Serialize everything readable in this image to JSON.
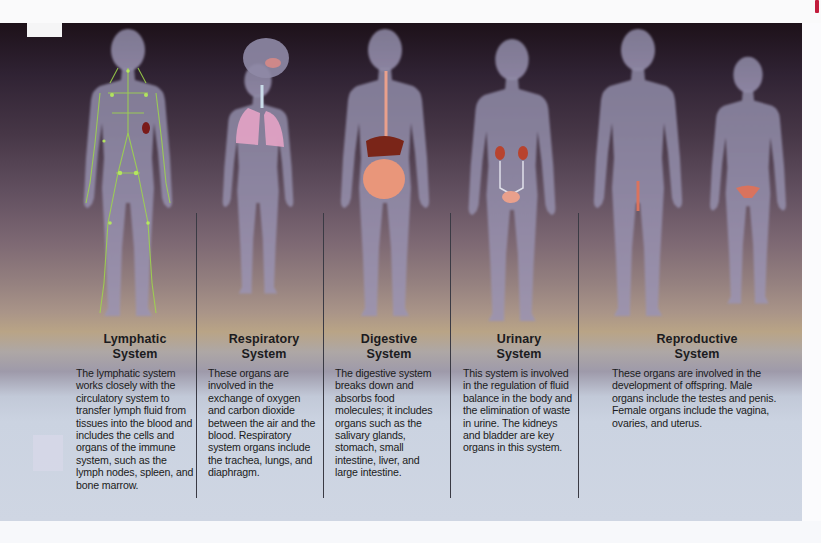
{
  "figure": {
    "systems": [
      {
        "id": "lymphatic",
        "title_line1": "Lymphatic",
        "title_line2": "System",
        "description": "The lymphatic system works closely with the circulatory system to transfer lymph fluid from tissues into the blood and includes the cells and organs of the immune system, such as the lymph nodes, spleen, and bone marrow.",
        "highlight_color": "#9fd84a"
      },
      {
        "id": "respiratory",
        "title_line1": "Respiratory",
        "title_line2": "System",
        "description": "These organs are involved in the exchange of oxygen and carbon dioxide between the air and the blood. Respiratory system organs include the trachea, lungs, and diaphragm.",
        "highlight_color": "#e8a8c6"
      },
      {
        "id": "digestive",
        "title_line1": "Digestive",
        "title_line2": "System",
        "description": "The digestive system breaks down and absorbs food molecules; it includes organs such as the salivary glands, stomach, small intestine, liver, and large intestine.",
        "highlight_color": "#e9967a"
      },
      {
        "id": "urinary",
        "title_line1": "Urinary",
        "title_line2": "System",
        "description": "This system is involved in the regulation of fluid balance in the body and the elimination of waste in urine. The kidneys and bladder are key organs in this system.",
        "highlight_color": "#c8503e"
      },
      {
        "id": "reproductive",
        "title_line1": "Reproductive",
        "title_line2": "System",
        "description": "These organs are involved in the development of offspring. Male organs include the testes and penis. Female organs include the vagina, ovaries, and uterus.",
        "highlight_color": "#d9735e"
      }
    ]
  },
  "colors": {
    "body_silhouette": "#8a7d9e",
    "text": "#1b1b20",
    "divider": "#3a3a44"
  }
}
